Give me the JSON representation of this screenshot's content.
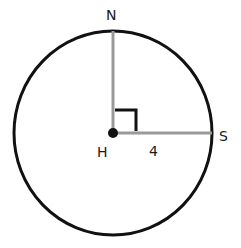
{
  "figure": {
    "type": "circle-radius-diagram",
    "center": {
      "label": "H",
      "x": 113,
      "y": 133
    },
    "circle": {
      "cx": 113,
      "cy": 133,
      "rx": 99,
      "ry": 102,
      "stroke": "#111111",
      "stroke_width": 3
    },
    "radii": [
      {
        "name": "HN",
        "from": "H",
        "to": "N",
        "x2": 113,
        "y2": 31,
        "color": "#9a9a9a"
      },
      {
        "name": "HS",
        "from": "H",
        "to": "S",
        "x2": 212,
        "y2": 133,
        "color": "#9a9a9a"
      }
    ],
    "right_angle_marker": {
      "x": 115,
      "y": 110,
      "size": 21
    },
    "points": {
      "N": {
        "label": "N"
      },
      "S": {
        "label": "S"
      },
      "H": {
        "label": "H"
      }
    },
    "measurements": {
      "HS_length": "4"
    }
  }
}
